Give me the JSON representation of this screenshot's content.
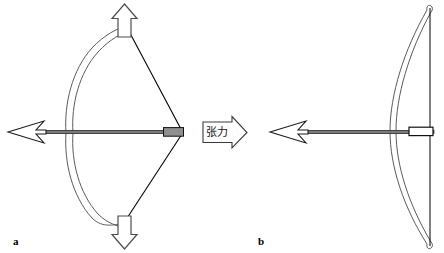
{
  "figure": {
    "title_visible": false,
    "background_color": "#ffffff",
    "stroke_color": "#000000",
    "limb_stroke_color": "#555555",
    "nock_fill_a": "#8c8c8c",
    "nock_fill_b": "#ffffff",
    "shaft_fill": "#6e6e6e",
    "width": 444,
    "height": 253
  },
  "panels": [
    {
      "id": "a",
      "label": "a",
      "description": "drawn bow with bent limbs and arrow nocked",
      "label_x": 13,
      "label_y": 236
    },
    {
      "id": "b",
      "label": "b",
      "description": "relaxed bow with straight string and arrow",
      "label_x": 258,
      "label_y": 236
    }
  ],
  "annotations": {
    "tension_label": "张力",
    "tension_label_x": 208,
    "tension_label_y": 134,
    "up_arrow_name": "upward-force-arrow",
    "down_arrow_name": "downward-force-arrow",
    "tension_arrow_name": "tension-force-arrow"
  },
  "elements": {
    "arrow_a_name": "arrow-a",
    "arrow_b_name": "arrow-b",
    "bow_a_name": "bow-a",
    "bow_b_name": "bow-b",
    "string_a_name": "bowstring-a",
    "string_b_name": "bowstring-b"
  }
}
